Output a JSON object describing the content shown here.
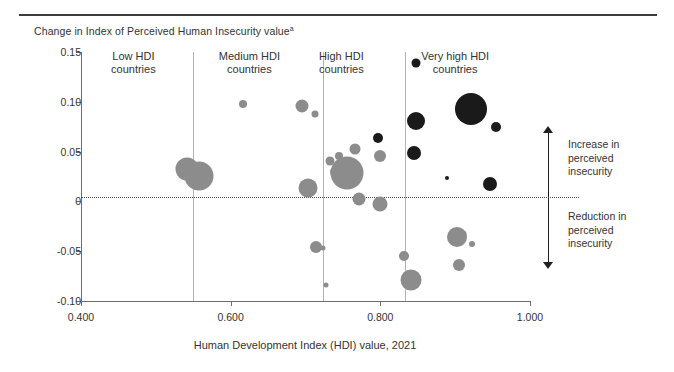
{
  "figure": {
    "y_axis_title": "Change in Index of Perceived Human Insecurity value",
    "y_axis_title_footnote": "a",
    "x_axis_title": "Human Development Index (HDI) value, 2021"
  },
  "annotations": {
    "increase": "Increase in\nperceived\ninsecurity",
    "increase_lines": [
      "Increase in",
      "perceived",
      "insecurity"
    ],
    "decrease": "Reduction in\nperceived\ninsecurity",
    "decrease_lines": [
      "Reduction in",
      "perceived",
      "insecurity"
    ],
    "arrow_up": "arrow-up-icon",
    "arrow_down": "arrow-down-icon"
  },
  "groups": [
    {
      "label_line1": "Low HDI",
      "label_line2": "countries",
      "center_hdi": 0.47
    },
    {
      "label_line1": "Medium HDI",
      "label_line2": "countries",
      "center_hdi": 0.625
    },
    {
      "label_line1": "High HDI",
      "label_line2": "countries",
      "center_hdi": 0.748
    },
    {
      "label_line1": "Very high HDI",
      "label_line2": "countries",
      "center_hdi": 0.9
    }
  ],
  "colors": {
    "bubble_grey": "#8c8c8c",
    "bubble_black": "#1a1a1a",
    "axis": "#6f6f6e",
    "divider": "#b3b3b3",
    "text": "#333333",
    "rule": "#3c3c3b"
  },
  "chart_data": {
    "type": "scatter",
    "title": "",
    "subtitle": "",
    "xlabel": "Human Development Index (HDI) value, 2021",
    "ylabel": "Change in Index of Perceived Human Insecurity value",
    "xlim": [
      0.4,
      1.0
    ],
    "ylim": [
      -0.1,
      0.15
    ],
    "xticks": [
      "0.400",
      "0.600",
      "0.800",
      "1.000"
    ],
    "xtick_values": [
      0.4,
      0.6,
      0.8,
      1.0
    ],
    "yticks": [
      "0.15",
      "0.10",
      "0.05",
      "0",
      "-0.05",
      "-0.10"
    ],
    "ytick_values": [
      0.15,
      0.1,
      0.05,
      0,
      -0.05,
      -0.1
    ],
    "grid": false,
    "legend": "none",
    "zero_reference_line": 0,
    "group_dividers_hdi": [
      0.55,
      0.723,
      0.833
    ],
    "size_encoding": "bubble area proportional to population",
    "series": [
      {
        "name": "Low / Medium / High HDI countries",
        "color": "#8c8c8c",
        "points": [
          {
            "hdi": 0.542,
            "change": 0.033,
            "size": 23
          },
          {
            "hdi": 0.558,
            "change": 0.026,
            "size": 29
          },
          {
            "hdi": 0.616,
            "change": 0.098,
            "size": 8
          },
          {
            "hdi": 0.695,
            "change": 0.096,
            "size": 13
          },
          {
            "hdi": 0.713,
            "change": 0.088,
            "size": 7
          },
          {
            "hdi": 0.704,
            "change": 0.013,
            "size": 19
          },
          {
            "hdi": 0.733,
            "change": 0.041,
            "size": 9
          },
          {
            "hdi": 0.745,
            "change": 0.046,
            "size": 8
          },
          {
            "hdi": 0.755,
            "change": 0.029,
            "size": 33
          },
          {
            "hdi": 0.741,
            "change": 0.03,
            "size": 12
          },
          {
            "hdi": 0.766,
            "change": 0.053,
            "size": 11
          },
          {
            "hdi": 0.771,
            "change": 0.002,
            "size": 13
          },
          {
            "hdi": 0.714,
            "change": -0.046,
            "size": 12
          },
          {
            "hdi": 0.723,
            "change": -0.047,
            "size": 5
          },
          {
            "hdi": 0.728,
            "change": -0.084,
            "size": 5
          },
          {
            "hdi": 0.8,
            "change": 0.046,
            "size": 12
          },
          {
            "hdi": 0.8,
            "change": -0.003,
            "size": 15
          },
          {
            "hdi": 0.832,
            "change": -0.055,
            "size": 10
          },
          {
            "hdi": 0.841,
            "change": -0.079,
            "size": 21
          },
          {
            "hdi": 0.903,
            "change": -0.036,
            "size": 20
          },
          {
            "hdi": 0.911,
            "change": -0.033,
            "size": 7
          },
          {
            "hdi": 0.923,
            "change": -0.043,
            "size": 6
          },
          {
            "hdi": 0.905,
            "change": -0.064,
            "size": 12
          }
        ]
      },
      {
        "name": "Very high HDI countries",
        "color": "#1a1a1a",
        "points": [
          {
            "hdi": 0.848,
            "change": 0.139,
            "size": 9
          },
          {
            "hdi": 0.921,
            "change": 0.093,
            "size": 32
          },
          {
            "hdi": 0.847,
            "change": 0.081,
            "size": 18
          },
          {
            "hdi": 0.955,
            "change": 0.075,
            "size": 10
          },
          {
            "hdi": 0.797,
            "change": 0.064,
            "size": 10
          },
          {
            "hdi": 0.845,
            "change": 0.049,
            "size": 14
          },
          {
            "hdi": 0.889,
            "change": 0.023,
            "size": 4
          },
          {
            "hdi": 0.947,
            "change": 0.017,
            "size": 14
          }
        ]
      }
    ]
  }
}
